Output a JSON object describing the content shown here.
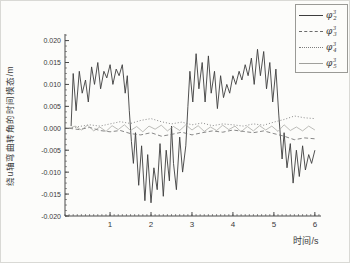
{
  "figure": {
    "ylabel": "绕u轴弯曲转角的时间模态/m",
    "xlabel": "时间/s"
  },
  "chart_data": {
    "type": "line",
    "title": "",
    "xlabel": "时间/s",
    "ylabel": "绕u轴弯曲转角的时间模态/m",
    "xlim": [
      -0.1,
      6.15
    ],
    "ylim": [
      -0.02,
      0.0215
    ],
    "xticks": [
      1,
      2,
      3,
      4,
      5,
      6
    ],
    "xtick_labels": [
      "1",
      "2",
      "3",
      "4",
      "5",
      "6"
    ],
    "x_minor_step": 0.1,
    "yticks": [
      0.02,
      0.015,
      0.01,
      0.005,
      0.0,
      -0.005,
      -0.01,
      -0.015,
      -0.02
    ],
    "ytick_labels": [
      "0.020",
      "0.015",
      "0.010",
      "0.005",
      "0.000",
      "-0.005",
      "-0.010",
      "-0.015",
      "-0.020"
    ],
    "y_minor_step": 0.00125,
    "grid": false,
    "legend_position": "top-right",
    "axis_color": "#4a4a4a",
    "y_unit": 0.001,
    "legend": [
      {
        "label": "φ³₂",
        "base": "φ",
        "sup": "3",
        "sub": "2"
      },
      {
        "label": "φ³₃",
        "base": "φ",
        "sup": "3",
        "sub": "3"
      },
      {
        "label": "φ³₄",
        "base": "φ",
        "sup": "3",
        "sub": "4"
      },
      {
        "label": "φ³₅",
        "base": "φ",
        "sup": "3",
        "sub": "5"
      }
    ],
    "series": [
      {
        "name": "φ³₂",
        "style": "solid",
        "color": "#3d3d3d",
        "width": 0.9,
        "x": [
          0.05,
          0.1,
          0.17,
          0.25,
          0.32,
          0.4,
          0.47,
          0.55,
          0.62,
          0.7,
          0.77,
          0.85,
          0.92,
          1.0,
          1.07,
          1.15,
          1.22,
          1.3,
          1.37,
          1.42,
          1.47,
          1.52,
          1.57,
          1.62,
          1.7,
          1.77,
          1.85,
          1.92,
          2.0,
          2.07,
          2.15,
          2.22,
          2.3,
          2.37,
          2.45,
          2.5,
          2.55,
          2.62,
          2.7,
          2.77,
          2.85,
          2.9,
          2.95,
          3.02,
          3.1,
          3.17,
          3.25,
          3.32,
          3.4,
          3.47,
          3.55,
          3.62,
          3.7,
          3.77,
          3.85,
          3.92,
          4.0,
          4.07,
          4.15,
          4.22,
          4.3,
          4.37,
          4.45,
          4.52,
          4.6,
          4.67,
          4.75,
          4.82,
          4.9,
          4.97,
          5.05,
          5.12,
          5.2,
          5.25,
          5.32,
          5.4,
          5.47,
          5.55,
          5.62,
          5.7,
          5.77,
          5.85,
          5.92,
          6.0
        ],
        "y": [
          0.5,
          12.5,
          4,
          13,
          8,
          11,
          6,
          14,
          10,
          15,
          9,
          13,
          11.5,
          14.5,
          10,
          13.5,
          12,
          14.5,
          8,
          12,
          4,
          -3,
          -8,
          -1,
          -13,
          -4,
          -16.5,
          -6,
          -17,
          -9,
          -14,
          -3.5,
          -15.5,
          -5,
          -12,
          0.5,
          -8,
          -14,
          -2,
          -10,
          -4,
          5,
          13,
          6,
          17,
          9,
          15,
          6,
          16.5,
          8,
          13,
          4.5,
          12,
          7,
          10,
          8,
          12,
          10,
          13,
          11,
          14.5,
          12,
          16,
          10,
          18,
          12,
          17.5,
          9,
          15,
          6,
          13.5,
          3,
          -7,
          -1,
          -9,
          -3.5,
          -12.5,
          -5,
          -11,
          -4,
          -9.5,
          -6,
          -8,
          -5
        ]
      },
      {
        "name": "φ³₃",
        "style": "dashed",
        "color": "#6a6a6a",
        "width": 0.8,
        "x": [
          0,
          0.25,
          0.5,
          0.75,
          1.0,
          1.25,
          1.5,
          1.75,
          2.0,
          2.25,
          2.5,
          2.75,
          3.0,
          3.25,
          3.5,
          3.75,
          4.0,
          4.25,
          4.5,
          4.75,
          5.0,
          5.25,
          5.5,
          5.75,
          6.0
        ],
        "y": [
          0,
          -0.3,
          0.2,
          -0.5,
          -0.8,
          -0.5,
          -1.2,
          -1.5,
          -1.0,
          -1.8,
          -1.4,
          -0.9,
          -1.5,
          -1.0,
          -0.6,
          -0.9,
          -0.4,
          -0.7,
          -1.0,
          -0.6,
          -1.2,
          -1.8,
          -2.6,
          -2.2,
          -2.4
        ]
      },
      {
        "name": "φ³₄",
        "style": "dotted",
        "color": "#7d7d7d",
        "width": 0.9,
        "x": [
          0,
          0.25,
          0.5,
          0.75,
          1.0,
          1.25,
          1.5,
          1.75,
          2.0,
          2.25,
          2.5,
          2.75,
          3.0,
          3.25,
          3.5,
          3.75,
          4.0,
          4.25,
          4.5,
          4.75,
          5.0,
          5.25,
          5.5,
          5.75,
          6.0
        ],
        "y": [
          0,
          0.4,
          0.8,
          0.5,
          1.0,
          1.5,
          1.1,
          1.8,
          2.2,
          1.5,
          1.0,
          1.4,
          0.8,
          1.2,
          0.6,
          1.0,
          0.8,
          0.5,
          1.0,
          0.7,
          1.4,
          2.0,
          2.8,
          2.4,
          2.2
        ]
      },
      {
        "name": "φ³₅",
        "style": "solid",
        "color": "#a0a09c",
        "width": 0.7,
        "x": [
          0,
          0.15,
          0.3,
          0.45,
          0.6,
          0.75,
          0.9,
          1.05,
          1.2,
          1.35,
          1.5,
          1.65,
          1.8,
          1.95,
          2.1,
          2.25,
          2.4,
          2.55,
          2.7,
          2.85,
          3.0,
          3.15,
          3.3,
          3.45,
          3.6,
          3.75,
          3.9,
          4.05,
          4.2,
          4.35,
          4.5,
          4.65,
          4.8,
          4.95,
          5.1,
          5.25,
          5.4,
          5.55,
          5.7,
          5.85,
          6.0
        ],
        "y": [
          0,
          0.5,
          -0.4,
          0.7,
          -0.6,
          0.3,
          -0.7,
          0.6,
          -0.3,
          0.8,
          -0.5,
          0.4,
          -0.8,
          0.5,
          -0.2,
          0.7,
          -0.6,
          0.4,
          -0.5,
          0.8,
          -0.4,
          0.6,
          -0.7,
          0.3,
          -0.5,
          0.7,
          -0.3,
          0.5,
          -0.8,
          0.4,
          -0.6,
          0.6,
          -0.4,
          0.5,
          -0.7,
          0.8,
          -0.5,
          0.3,
          -0.6,
          0.5,
          -0.4
        ]
      }
    ]
  }
}
